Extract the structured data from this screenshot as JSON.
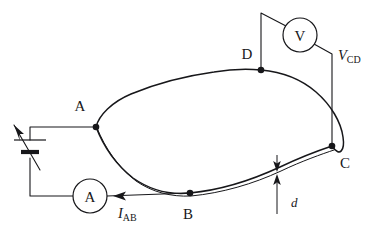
{
  "figure": {
    "background_color": "#ffffff",
    "line_color": "#17171a"
  },
  "contacts": {
    "a": {
      "label": "A",
      "x": 96,
      "y": 127
    },
    "b": {
      "label": "B",
      "x": 190,
      "y": 193
    },
    "c": {
      "label": "C",
      "x": 332,
      "y": 146
    },
    "d": {
      "label": "D",
      "x": 261,
      "y": 70
    }
  },
  "meters": {
    "ammeter": {
      "label": "A",
      "name": "ammeter",
      "cx": 90,
      "cy": 196,
      "r": 17
    },
    "voltmeter": {
      "label": "V",
      "name": "voltmeter",
      "cx": 300,
      "cy": 35,
      "r": 17
    }
  },
  "annotations": {
    "current": {
      "symbol": "I",
      "subscript": "AB",
      "x": 118,
      "y": 218
    },
    "voltage": {
      "symbol": "V",
      "subscript": "CD",
      "x": 338,
      "y": 60
    },
    "thickness": {
      "symbol": "d",
      "x": 291,
      "y": 207
    }
  },
  "source": {
    "name": "variable-voltage-source",
    "description": "variable cell with diagonal arrow"
  }
}
